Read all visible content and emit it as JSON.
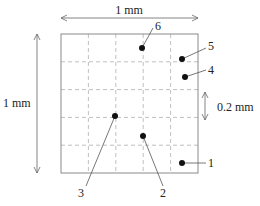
{
  "diagram": {
    "frame": {
      "x": 61,
      "y": 34,
      "width": 137,
      "height": 139,
      "columns": 5,
      "rows": 5
    },
    "labels": {
      "width_dimension": "1 mm",
      "height_dimension": "1 mm",
      "cell_dimension": "0.2 mm"
    },
    "points": [
      {
        "id": "1",
        "label": "1",
        "x": 182,
        "y": 163,
        "label_x": 211,
        "label_y": 167,
        "line_end_x": 206,
        "line_end_y": 163
      },
      {
        "id": "2",
        "label": "2",
        "x": 143,
        "y": 136,
        "label_x": 163,
        "label_y": 196,
        "line_end_x": 163,
        "line_end_y": 186
      },
      {
        "id": "3",
        "label": "3",
        "x": 115,
        "y": 116,
        "label_x": 80,
        "label_y": 196,
        "line_end_x": 86,
        "line_end_y": 186
      },
      {
        "id": "4",
        "label": "4",
        "x": 185,
        "y": 77,
        "label_x": 209,
        "label_y": 73,
        "line_end_x": 206,
        "line_end_y": 70
      },
      {
        "id": "5",
        "label": "5",
        "x": 182,
        "y": 59,
        "label_x": 209,
        "label_y": 50,
        "line_end_x": 206,
        "line_end_y": 48
      },
      {
        "id": "6",
        "label": "6",
        "x": 142,
        "y": 48,
        "label_x": 154,
        "label_y": 30,
        "line_end_x": 153,
        "line_end_y": 28
      }
    ],
    "colors": {
      "frame": "#8a8a8a",
      "grid": "#b0b0b0",
      "dot": "#111111",
      "leader": "#555555",
      "dimension": "#666666"
    }
  }
}
